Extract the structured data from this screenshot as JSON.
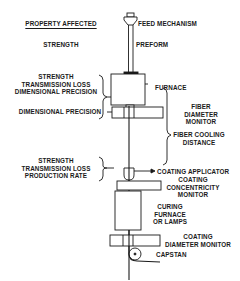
{
  "diagram": {
    "left_column": {
      "header": "PROPERTY AFFECTED",
      "groups": [
        {
          "lines": [
            "STRENGTH"
          ]
        },
        {
          "lines": [
            "STRENGTH",
            "TRANSMISSION LOSS",
            "DIMENSIONAL PRECISION"
          ]
        },
        {
          "lines": [
            "DIMENSIONAL PRECISION"
          ]
        },
        {
          "lines": [
            "STRENGTH",
            "TRANSMISSION LOSS",
            "PRODUCTION RATE"
          ]
        }
      ]
    },
    "components": [
      {
        "id": "feed",
        "lines": [
          "FEED MECHANISM"
        ]
      },
      {
        "id": "preform",
        "lines": [
          "PREFORM"
        ]
      },
      {
        "id": "furnace",
        "lines": [
          "FURNACE"
        ]
      },
      {
        "id": "fiber_diameter_monitor",
        "lines": [
          "FIBER",
          "DIAMETER",
          "MONITOR"
        ]
      },
      {
        "id": "fiber_cooling",
        "lines": [
          "FIBER COOLING",
          "DISTANCE"
        ]
      },
      {
        "id": "coating_applicator",
        "lines": [
          "COATING APPLICATOR"
        ]
      },
      {
        "id": "coating_concentricity",
        "lines": [
          "COATING",
          "CONCENTRICITY",
          "MONITOR"
        ]
      },
      {
        "id": "curing",
        "lines": [
          "CURING",
          "FURNACE",
          "OR LAMPS"
        ]
      },
      {
        "id": "coating_diameter",
        "lines": [
          "COATING",
          "DIAMETER MONITOR"
        ]
      },
      {
        "id": "capstan",
        "lines": [
          "CAPSTAN"
        ]
      }
    ],
    "colors": {
      "ink": "#1a1a1a",
      "background": "#ffffff"
    }
  }
}
